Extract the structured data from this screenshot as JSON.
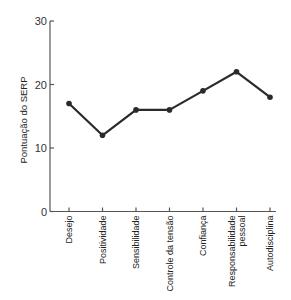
{
  "chart_data": {
    "type": "line",
    "title": "",
    "xlabel": "",
    "ylabel": "Pontuação do SERP",
    "ylim": [
      0,
      30
    ],
    "yticks": [
      0,
      10,
      20,
      30
    ],
    "grid": false,
    "legend": null,
    "categories": [
      "Desejo",
      "Positividade",
      "Sensibilidade",
      "Controle da tensão",
      "Confiança",
      "Responsabilidade pessoal",
      "Autodisciplina"
    ],
    "category_label_lines": [
      [
        "Desejo"
      ],
      [
        "Positividade"
      ],
      [
        "Sensibilidade"
      ],
      [
        "Controle da tensão"
      ],
      [
        "Confiança"
      ],
      [
        "Responsabilidade",
        "pessoal"
      ],
      [
        "Autodisciplina"
      ]
    ],
    "series": [
      {
        "name": "Pontuação do SERP",
        "values": [
          17,
          12,
          16,
          16,
          19,
          22,
          18
        ]
      }
    ]
  },
  "colors": {
    "line": "#2a2a2a",
    "axis": "#555555",
    "text": "#222222"
  }
}
